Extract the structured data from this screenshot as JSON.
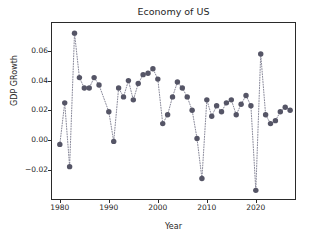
{
  "chart_data": {
    "type": "scatter",
    "title": "Economy of US",
    "xlabel": "Year",
    "ylabel": "GDP GRowth",
    "grid": false,
    "legend": null,
    "marker": {
      "style": "circle",
      "color": "#555566",
      "size": 4.2,
      "linestyle": "dotted",
      "linecolor": "#888899"
    },
    "xlim": [
      1978.2,
      2028.2
    ],
    "ylim": [
      -0.0405,
      0.0795
    ],
    "xticks": [
      1980,
      1990,
      2000,
      2010,
      2020
    ],
    "xtick_labels": [
      "1980",
      "1990",
      "2000",
      "2010",
      "2020"
    ],
    "yticks": [
      -0.02,
      0.0,
      0.02,
      0.04,
      0.06
    ],
    "ytick_labels": [
      "−0.02",
      "0.00",
      "0.02",
      "0.04",
      "0.06"
    ],
    "x": [
      1980,
      1981,
      1982,
      1983,
      1984,
      1985,
      1986,
      1987,
      1988,
      1990,
      1991,
      1992,
      1993,
      1994,
      1995,
      1996,
      1997,
      1998,
      1999,
      2000,
      2001,
      2002,
      2003,
      2004,
      2005,
      2006,
      2007,
      2008,
      2009,
      2010,
      2011,
      2012,
      2013,
      2014,
      2015,
      2016,
      2017,
      2018,
      2019,
      2020,
      2021,
      2022,
      2023,
      2024,
      2025,
      2026,
      2027
    ],
    "values": [
      -0.003,
      0.025,
      -0.018,
      0.072,
      0.042,
      0.035,
      0.035,
      0.042,
      0.037,
      0.019,
      -0.001,
      0.035,
      0.029,
      0.04,
      0.027,
      0.038,
      0.044,
      0.045,
      0.048,
      0.041,
      0.011,
      0.017,
      0.029,
      0.039,
      0.035,
      0.029,
      0.02,
      0.001,
      -0.026,
      0.027,
      0.016,
      0.023,
      0.019,
      0.025,
      0.027,
      0.017,
      0.024,
      0.03,
      0.023,
      -0.034,
      0.058,
      0.017,
      0.011,
      0.013,
      0.019,
      0.022,
      0.02
    ]
  }
}
